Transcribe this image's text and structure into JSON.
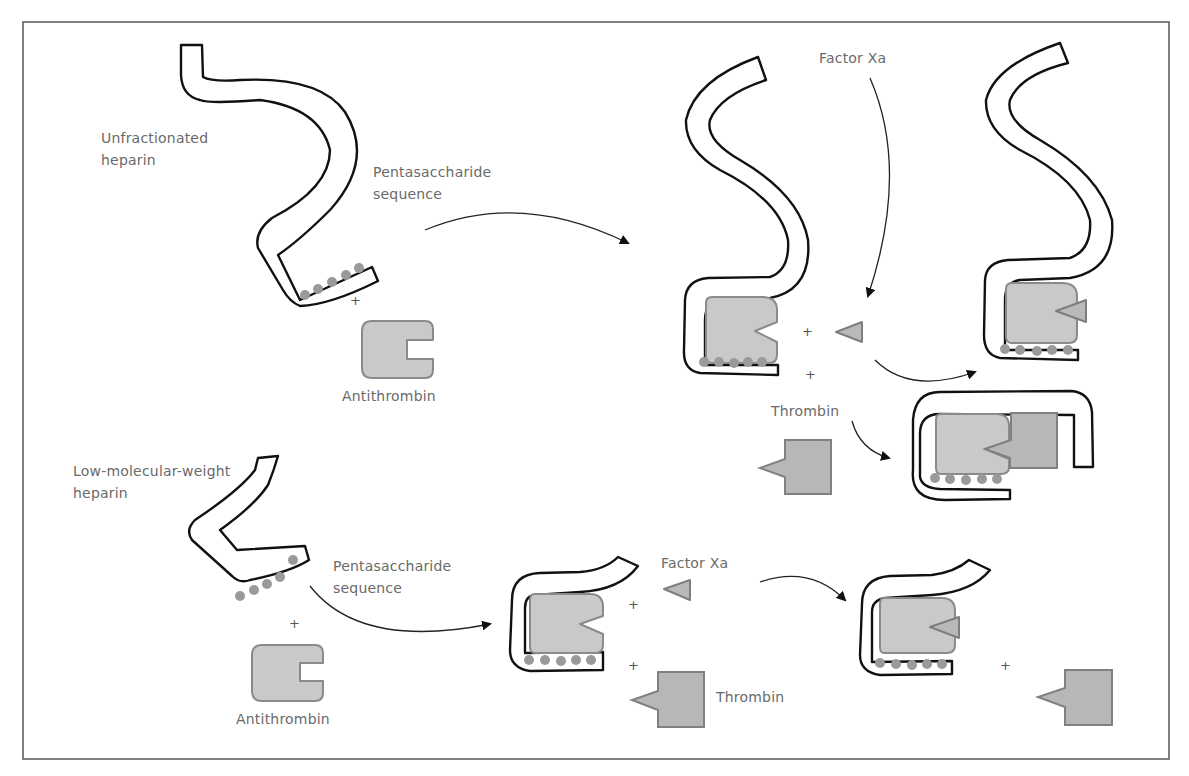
{
  "figure": {
    "colors": {
      "chain_stroke": "#111111",
      "protein_fill": "#c9c9c9",
      "protein_stroke": "#8a8a8a",
      "pentasaccharide_dot": "#9a9a9a",
      "label_text": "#6a6a6a",
      "frame": "#555555"
    }
  },
  "top_panel": {
    "heparin_label_line1": "Unfractionated",
    "heparin_label_line2": "heparin",
    "pentasaccharide_line1": "Pentasaccharide",
    "pentasaccharide_line2": "sequence",
    "antithrombin_label": "Antithrombin",
    "factor_xa_label": "Factor Xa",
    "thrombin_label": "Thrombin",
    "plus_sign": "+",
    "pentasaccharide_dot_count": 5
  },
  "bottom_panel": {
    "heparin_label_line1": "Low-molecular-weight",
    "heparin_label_line2": "heparin",
    "pentasaccharide_line1": "Pentasaccharide",
    "pentasaccharide_line2": "sequence",
    "antithrombin_label": "Antithrombin",
    "factor_xa_label": "Factor Xa",
    "thrombin_label": "Thrombin",
    "plus_sign": "+",
    "pentasaccharide_dot_count": 5
  }
}
